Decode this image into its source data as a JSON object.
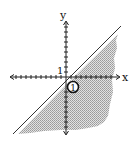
{
  "diagram": {
    "type": "linear-inequality-graph",
    "axes": {
      "x_label": "x",
      "y_label": "y",
      "tick_label": "1"
    },
    "boundary_line": {
      "style": "solid",
      "description": "line through origin with positive slope, y = x"
    },
    "shaded_region": "below the line",
    "marker": {
      "label": "1",
      "style": "circled"
    },
    "colors": {
      "axis": "#222222",
      "line": "#333333",
      "shading": "#c8c8c8",
      "background": "#ffffff"
    }
  }
}
